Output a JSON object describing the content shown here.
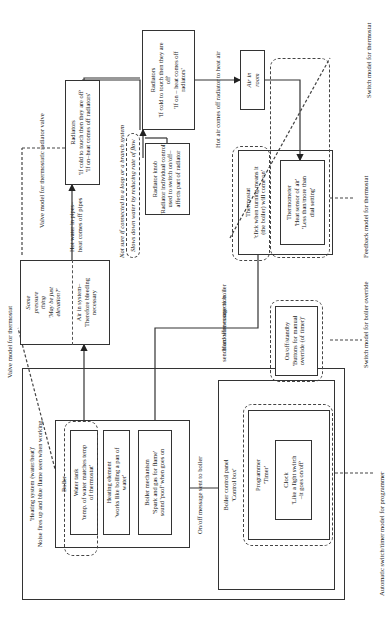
{
  "heating_system": {
    "title": "'Heating system (water/heat)'",
    "subtitle": "Noise fires up and blue flame seen when working"
  },
  "boiler": {
    "label": "Boiler",
    "water_tank": "Water tank\n'temp. of water matches temp\nof thermostat'",
    "heating_element": "Heating element\n'works like boiling a pan of\nwater'",
    "mechanism": "Boiler mechanism\n'Spark and gas for flame'\nsound 'poof' when goes on"
  },
  "pressure_box": {
    "top": "Some\npressure\nthing\n'May be just\nelevation?'",
    "bottom": "Air in system–\nTherefore bleeding\nnecessary"
  },
  "control_panel": {
    "label": "Boiler control panel\n'Control box'",
    "programmer": "Programmer\n'Timer'",
    "clock": "Clock\n'Like a light switch\n–it goes on/off'",
    "onoff": "On/off/standby\n'Buttons for manual\noverride (of timer)'"
  },
  "radiators_1": "Radiators\n'If cold to touch then they are off'\n'If on–heat comes off radiators'",
  "radiators_2": "Radiators\n'If cold to touch then they are\noff'\n'If on – heat comes off\nradiators'",
  "radiator_knob": "Radiator knob\n'Radiator individual control'\nused to switch on/off–\naffects part of radiator",
  "air_in_room": "Air in\nroom",
  "thermostat": "Thermostat\n'click when turning means it\n(the boiler) will come on'",
  "thermometer": "Thermometer\n'Heat sensor of air'\n'Less than/more than\ndial setting'",
  "labels": {
    "onoff_message": "On/off message sent to boiler",
    "hard_wire_1": "Hard wire connection",
    "hard_wire_2": "sends on/off message to boiler",
    "hot_water_1": "Hot water in pipes–",
    "hot_water_2": "heat comes off pipes",
    "not_sure": "Not sure if connected in a loop or a branch system",
    "slows_down": "Slows down water by reducing rate of flow",
    "hot_air": "Hot air comes off radiator to heat air"
  },
  "annotations": {
    "valve_thermostat": "Valve model for thermostat",
    "valve_radiator": "Valve model for thermostatic radiator valve",
    "switch_thermostat": "Switch model for thermostat",
    "feedback_thermostat": "Feedback model for thermostat",
    "switch_boiler": "Switch model for boiler override",
    "auto_programmer": "Automatic switch/timer model for programmer"
  }
}
